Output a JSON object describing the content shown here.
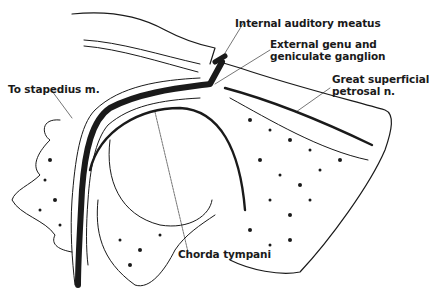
{
  "figure": {
    "labels": [
      {
        "id": "internal-auditory-meatus",
        "lines": [
          "Internal auditory meatus"
        ]
      },
      {
        "id": "external-genu",
        "lines": [
          "External genu and",
          "geniculate ganglion"
        ]
      },
      {
        "id": "great-superficial-petrosal",
        "lines": [
          "Great superficial",
          "petrosal n."
        ]
      },
      {
        "id": "to-stapedius",
        "lines": [
          "To stapedius m."
        ]
      },
      {
        "id": "chorda-tympani",
        "lines": [
          "Chorda tympani"
        ]
      }
    ],
    "colors": {
      "ink": "#1a1a1a",
      "background": "#ffffff"
    }
  }
}
